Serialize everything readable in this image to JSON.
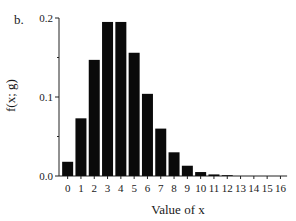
{
  "panel_label": "b.",
  "chart_data": {
    "type": "bar",
    "title": "",
    "xlabel": "Value of x",
    "ylabel": "f(x; g)",
    "categories": [
      "0",
      "1",
      "2",
      "3",
      "4",
      "5",
      "6",
      "7",
      "8",
      "9",
      "10",
      "11",
      "12",
      "13",
      "14",
      "15",
      "16"
    ],
    "values": [
      0.018,
      0.073,
      0.147,
      0.195,
      0.195,
      0.156,
      0.104,
      0.06,
      0.03,
      0.013,
      0.005,
      0.002,
      0.001,
      0.0,
      0.0,
      0.0,
      0.0
    ],
    "ylim": [
      0.0,
      0.2
    ],
    "yticks": [
      "0.0",
      "0.1",
      "0.2"
    ],
    "grid": false,
    "legend": null,
    "bar_color": "#0a0a0a"
  }
}
